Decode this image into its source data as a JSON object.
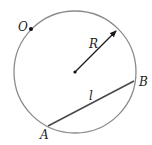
{
  "diagram": {
    "title": "",
    "colors": {
      "circle": "#8a8a8a",
      "chord": "#4a4a4a",
      "radius": "#1a1a1a",
      "points": "#111111",
      "text": "#222222"
    },
    "circle": {
      "center": {
        "x": 75,
        "y": 72
      },
      "radius": 61
    },
    "points": {
      "O": {
        "label": "O",
        "x": 31,
        "y": 29,
        "label_x": 18,
        "label_y": 31
      },
      "center": {
        "x": 75,
        "y": 72
      },
      "A": {
        "label": "A",
        "x": 48,
        "y": 126,
        "label_x": 40,
        "label_y": 139
      },
      "B": {
        "label": "B",
        "x": 134,
        "y": 81,
        "label_x": 139,
        "label_y": 86
      }
    },
    "radius_arrow": {
      "label": "R",
      "from": {
        "x": 75,
        "y": 72
      },
      "to": {
        "x": 117,
        "y": 30
      },
      "label_x": 89,
      "label_y": 48
    },
    "chord": {
      "label": "l",
      "from": "A",
      "to": "B",
      "label_x": 89,
      "label_y": 100
    }
  }
}
